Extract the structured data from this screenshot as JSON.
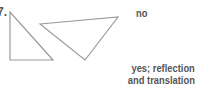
{
  "problem": {
    "number": "7.",
    "answers": {
      "first": "no",
      "second_line1": "yes; reflection",
      "second_line2": "and translation"
    },
    "figures": {
      "triangle_left": {
        "points": "10,12 10,60 53,60"
      },
      "triangle_right": {
        "points": "40,24 118,17 85,60"
      },
      "stroke_color": "#999999"
    }
  }
}
